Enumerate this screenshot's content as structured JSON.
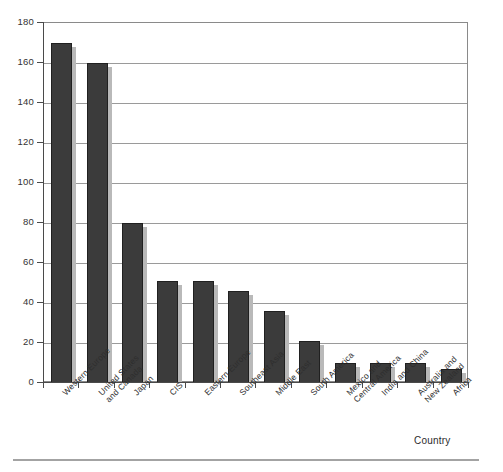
{
  "chart_data": {
    "type": "bar",
    "title": "",
    "subtitle": "",
    "xlabel": "Country",
    "ylabel": "",
    "ylim": [
      0,
      180
    ],
    "yticks": [
      0,
      20,
      40,
      60,
      80,
      100,
      120,
      140,
      160,
      180
    ],
    "grid": true,
    "legend": false,
    "categories": [
      "Western Europe",
      "United States\nand Canada",
      "Japan",
      "CIS",
      "Eastern Europe",
      "Southeast Asia",
      "Middle East",
      "South America",
      "Mexico and\nCentral America",
      "India and China",
      "Australia and\nNew Zealand",
      "Africa"
    ],
    "values": [
      170,
      160,
      80,
      51,
      51,
      46,
      36,
      21,
      10,
      10,
      10,
      7
    ],
    "series": [
      {
        "name": "Country",
        "values": [
          170,
          160,
          80,
          51,
          51,
          46,
          36,
          21,
          10,
          10,
          10,
          7
        ]
      }
    ],
    "bar_color": "#3b3b3b",
    "bar_edge_color": "#202020",
    "bar_shadow_color": "#b9b9b9",
    "gridline_color": "#9a9a9a",
    "axis_color": "#4a4a4a",
    "background_color": "#ffffff"
  }
}
